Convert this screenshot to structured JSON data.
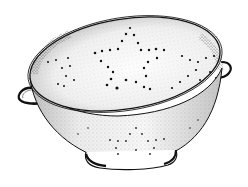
{
  "image": {
    "subject": "colander",
    "style": "stippled pen-and-ink illustration",
    "colors": {
      "background": "#ffffff",
      "ink": "#111111",
      "shade": "#9a9a9a",
      "light_shade": "#d6d6d6"
    },
    "features": [
      "star pattern of holes on inner bowl",
      "star pattern of holes on outer bowl",
      "left loop handle",
      "right loop handle",
      "footed base ring"
    ]
  }
}
